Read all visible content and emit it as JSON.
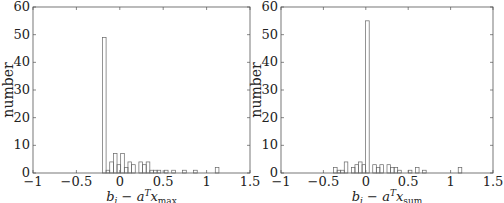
{
  "chart_data": [
    {
      "type": "bar",
      "title": "",
      "xlabel": "b_i − a_i^T x_max",
      "xlabel_parts": {
        "b": "b",
        "i": "i",
        "minus": " − ",
        "a": "a",
        "sup": "T",
        "x": "x",
        "sub": "max"
      },
      "ylabel": "number",
      "xlim": [
        -1,
        1.5
      ],
      "ylim": [
        0,
        60
      ],
      "xticks": [
        "−1",
        "−0.5",
        "0",
        "0.5",
        "1",
        "1.5"
      ],
      "yticks": [
        "0",
        "10",
        "20",
        "30",
        "40",
        "50",
        "60"
      ],
      "bin_width": 0.042,
      "bins": [
        {
          "x": -0.2,
          "count": 49
        },
        {
          "x": -0.158,
          "count": 1
        },
        {
          "x": -0.116,
          "count": 4
        },
        {
          "x": -0.074,
          "count": 7
        },
        {
          "x": -0.032,
          "count": 3
        },
        {
          "x": 0.01,
          "count": 7
        },
        {
          "x": 0.052,
          "count": 2
        },
        {
          "x": 0.094,
          "count": 4
        },
        {
          "x": 0.136,
          "count": 3
        },
        {
          "x": 0.22,
          "count": 4
        },
        {
          "x": 0.262,
          "count": 3
        },
        {
          "x": 0.304,
          "count": 4
        },
        {
          "x": 0.346,
          "count": 1
        },
        {
          "x": 0.388,
          "count": 1
        },
        {
          "x": 0.43,
          "count": 1
        },
        {
          "x": 0.514,
          "count": 1
        },
        {
          "x": 0.598,
          "count": 1
        },
        {
          "x": 0.724,
          "count": 1
        },
        {
          "x": 0.85,
          "count": 1
        },
        {
          "x": 1.1,
          "count": 2
        }
      ]
    },
    {
      "type": "bar",
      "title": "",
      "xlabel": "b_i − a_i^T x_sum",
      "xlabel_parts": {
        "b": "b",
        "i": "i",
        "minus": " − ",
        "a": "a",
        "sup": "T",
        "x": "x",
        "sub": "sum"
      },
      "ylabel": "number",
      "xlim": [
        -1,
        1.5
      ],
      "ylim": [
        0,
        60
      ],
      "xticks": [
        "−1",
        "−0.5",
        "0",
        "0.5",
        "1",
        "1.5"
      ],
      "yticks": [
        "0",
        "10",
        "20",
        "30",
        "40",
        "50",
        "60"
      ],
      "bin_width": 0.042,
      "bins": [
        {
          "x": -0.48,
          "count": 2
        },
        {
          "x": -0.438,
          "count": 1
        },
        {
          "x": -0.396,
          "count": 1
        },
        {
          "x": -0.354,
          "count": 4
        },
        {
          "x": -0.27,
          "count": 2
        },
        {
          "x": -0.228,
          "count": 3
        },
        {
          "x": -0.186,
          "count": 4
        },
        {
          "x": -0.144,
          "count": 3
        },
        {
          "x": -0.102,
          "count": 55
        },
        {
          "x": -0.018,
          "count": 3
        },
        {
          "x": 0.024,
          "count": 2
        },
        {
          "x": 0.066,
          "count": 3
        },
        {
          "x": 0.15,
          "count": 3
        },
        {
          "x": 0.192,
          "count": 2
        },
        {
          "x": 0.234,
          "count": 2
        },
        {
          "x": 0.276,
          "count": 1
        },
        {
          "x": 0.402,
          "count": 1
        },
        {
          "x": 0.486,
          "count": 2
        },
        {
          "x": 0.57,
          "count": 1
        },
        {
          "x": 0.99,
          "count": 2
        }
      ]
    }
  ]
}
